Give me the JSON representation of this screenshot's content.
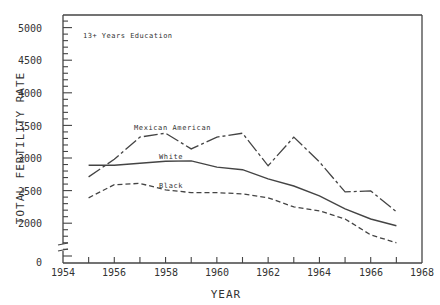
{
  "chart_data": {
    "type": "line",
    "title": "",
    "annotation": "13+ Years Education",
    "xlabel": "YEAR",
    "ylabel": "TOTAL FERTILITY RATE",
    "xlim": [
      1954,
      1968
    ],
    "ylim": [
      0,
      5200
    ],
    "y_axis_break": true,
    "grid": false,
    "legend": "inline labels",
    "x_ticks": [
      "1954",
      "1956",
      "1958",
      "1960",
      "1962",
      "1964",
      "1966",
      "1968"
    ],
    "y_ticks": [
      "0",
      "2000",
      "2500",
      "3000",
      "3500",
      "4000",
      "4500",
      "5000"
    ],
    "x": [
      1955,
      1956,
      1957,
      1958,
      1959,
      1960,
      1961,
      1962,
      1963,
      1964,
      1965,
      1966,
      1967
    ],
    "series": [
      {
        "name": "Mexican American",
        "style": "dash-dot",
        "values": [
          2710,
          2980,
          3320,
          3380,
          3140,
          3320,
          3380,
          2880,
          3320,
          2940,
          2480,
          2495,
          2175
        ]
      },
      {
        "name": "White",
        "style": "solid",
        "values": [
          2890,
          2890,
          2920,
          2950,
          2955,
          2860,
          2820,
          2680,
          2570,
          2420,
          2220,
          2065,
          1960
        ]
      },
      {
        "name": "Black",
        "style": "dashed",
        "values": [
          2390,
          2590,
          2610,
          2510,
          2470,
          2470,
          2450,
          2390,
          2250,
          2190,
          2065,
          1820,
          1700
        ]
      }
    ]
  },
  "labels": {
    "annotation": "13+ Years Education",
    "xlabel": "YEAR",
    "ylabel": "TOTAL FERTILITY RATE",
    "series_mexican": "Mexican American",
    "series_white": "White",
    "series_black": "Black",
    "x_ticks": [
      "1954",
      "1956",
      "1958",
      "1960",
      "1962",
      "1964",
      "1966",
      "1968"
    ],
    "y_ticks": {
      "y5000": "5000",
      "y4500": "4500",
      "y4000": "4000",
      "y3500": "3500",
      "y3000": "3000",
      "y2500": "2500",
      "y2000": "2000",
      "y0": "0"
    }
  }
}
